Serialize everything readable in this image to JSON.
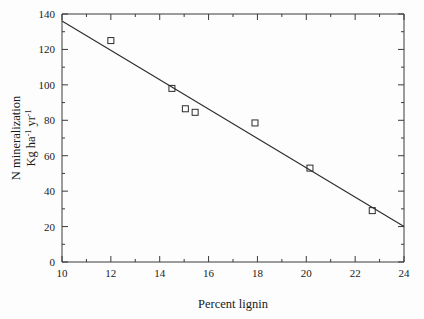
{
  "chart_data": {
    "type": "scatter",
    "title": "",
    "xlabel": "Percent lignin",
    "ylabel_line1": "N mineralization",
    "ylabel_line2_base": "Kg ha",
    "ylabel_line2_sup1": "-1",
    "ylabel_line2_mid": " yr",
    "ylabel_line2_sup2": "-1",
    "xlim": [
      10,
      24
    ],
    "ylim": [
      0,
      140
    ],
    "xticks": [
      10,
      12,
      14,
      16,
      18,
      20,
      22,
      24
    ],
    "yticks": [
      0,
      20,
      40,
      60,
      80,
      100,
      120,
      140
    ],
    "xtick_labels": [
      "10",
      "12",
      "14",
      "16",
      "18",
      "20",
      "22",
      "24"
    ],
    "ytick_labels": [
      "0",
      "20",
      "40",
      "60",
      "80",
      "100",
      "120",
      "140"
    ],
    "xminor_step": 1,
    "yminor_step": 10,
    "grid": false,
    "legend": "none",
    "marker_style": "open-square",
    "points": [
      {
        "x": 12.0,
        "y": 125.0
      },
      {
        "x": 14.5,
        "y": 98.0
      },
      {
        "x": 15.05,
        "y": 86.5
      },
      {
        "x": 15.45,
        "y": 84.5
      },
      {
        "x": 17.9,
        "y": 78.5
      },
      {
        "x": 20.15,
        "y": 53.0
      },
      {
        "x": 22.7,
        "y": 29.0
      }
    ],
    "series": [
      {
        "name": "N mineralization vs percent lignin",
        "x": [
          12.0,
          14.5,
          15.05,
          15.45,
          17.9,
          20.15,
          22.7
        ],
        "values": [
          125.0,
          98.0,
          86.5,
          84.5,
          78.5,
          53.0,
          29.0
        ]
      }
    ],
    "trend_line": {
      "x_start": 10,
      "y_start": 136,
      "x_end": 24,
      "y_end": 20,
      "slope": -8.29,
      "intercept": 218.9
    },
    "colors": {
      "axis": "#3a3a3a",
      "marker": "#2b2b2b",
      "line": "#2b2b2b",
      "text": "#1a1a1a",
      "background": "#fdfdfd"
    }
  }
}
